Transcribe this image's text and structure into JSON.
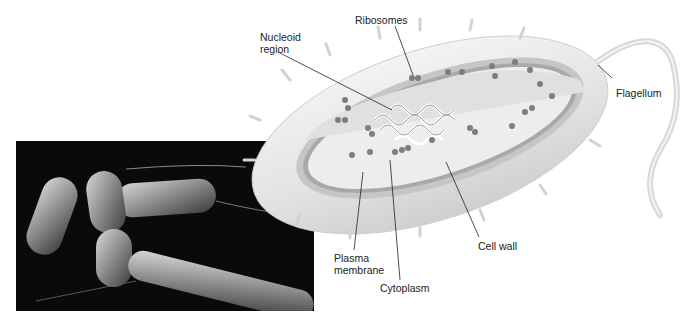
{
  "figure": {
    "labels": {
      "ribosomes": "Ribosomes",
      "nucleoid_line1": "Nucleoid",
      "nucleoid_line2": "region",
      "flagellum": "Flagellum",
      "cell_wall": "Cell wall",
      "plasma_line1": "Plasma",
      "plasma_line2": "membrane",
      "cytoplasm": "Cytoplasm"
    },
    "colors": {
      "background": "#ffffff",
      "cell_outer": "#e6e6e6",
      "cell_wall": "#c8c8c8",
      "membrane": "#a8a8a8",
      "cytoplasm": "#eeeeee",
      "ribosome": "#7a7a7a",
      "photo_bg": "#0a0a0a",
      "leader_line": "#222222"
    }
  }
}
